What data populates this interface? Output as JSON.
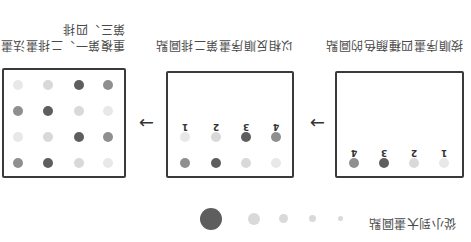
{
  "colors": {
    "dark": "#5e5e5e",
    "medium": "#8f8f8f",
    "light": "#d9d9d9",
    "lighter": "#e8e8e8",
    "outline": "#3a3a3a"
  },
  "legend": {
    "caption": "從小到大畫圓點",
    "dot_sizes": [
      "tiny",
      "small",
      "medium",
      "large",
      "extra-large"
    ]
  },
  "panels": [
    {
      "id": "step1",
      "caption": "按順序畫四種顏色的圓點",
      "labels": [
        "1",
        "2",
        "3",
        "4"
      ],
      "rows": [
        [
          "dark",
          "dark",
          "light",
          "lighter"
        ]
      ]
    },
    {
      "id": "step2",
      "caption": "以相反順序畫第二排圓點",
      "labels": [
        "1",
        "2",
        "3",
        "4"
      ],
      "rows": [
        [
          "medium",
          "dark",
          "light",
          "lighter"
        ],
        [
          "light",
          "lighter",
          "dark",
          "medium"
        ]
      ]
    },
    {
      "id": "step3",
      "caption_line1": "重複第一、二排畫法畫",
      "caption_line2": "第三、四排",
      "rows": [
        [
          "medium",
          "dark",
          "light",
          "lighter"
        ],
        [
          "light",
          "light",
          "dark",
          "medium"
        ],
        [
          "medium",
          "dark",
          "light",
          "lighter"
        ],
        [
          "light",
          "light",
          "dark",
          "medium"
        ]
      ]
    }
  ],
  "arrows": [
    "→",
    "→"
  ]
}
